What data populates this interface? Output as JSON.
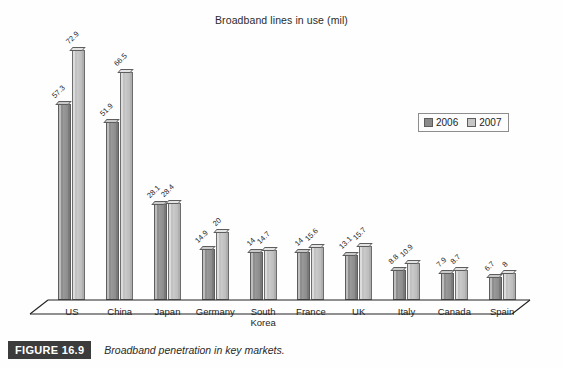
{
  "figure": {
    "badge": "FIGURE 16.9",
    "caption": "Broadband penetration in key markets."
  },
  "legend": {
    "position": "right",
    "entries": [
      {
        "label": "2006",
        "color": "#8a8a8a"
      },
      {
        "label": "2007",
        "color": "#c6c6c6"
      }
    ]
  },
  "chart_data": {
    "type": "bar",
    "title": "Broadband lines in use (mil)",
    "xlabel": "",
    "ylabel": "",
    "ylim": [
      0,
      80
    ],
    "grid": false,
    "legend_position": "right",
    "categories": [
      "US",
      "China",
      "Japan",
      "Germany",
      "South Korea",
      "France",
      "UK",
      "Italy",
      "Canada",
      "Spain"
    ],
    "category_labels": [
      [
        "US"
      ],
      [
        "China"
      ],
      [
        "Japan"
      ],
      [
        "Germany"
      ],
      [
        "South",
        "Korea"
      ],
      [
        "France"
      ],
      [
        "UK"
      ],
      [
        "Italy"
      ],
      [
        "Canada"
      ],
      [
        "Spain"
      ]
    ],
    "series": [
      {
        "name": "2006",
        "color": "#8a8a8a",
        "values": [
          57.3,
          51.9,
          28.1,
          14.9,
          14,
          14,
          13.1,
          8.8,
          7.9,
          6.7
        ],
        "labels": [
          "57.3",
          "51.9",
          "28.1",
          "14.9",
          "14",
          "14",
          "13.1",
          "8.8",
          "7.9",
          "6.7"
        ]
      },
      {
        "name": "2007",
        "color": "#c6c6c6",
        "values": [
          72.9,
          66.5,
          28.4,
          20,
          14.7,
          15.6,
          15.7,
          10.9,
          8.7,
          8
        ],
        "labels": [
          "72.9",
          "66.5",
          "28.4",
          "20",
          "14.7",
          "15.6",
          "15.7",
          "10.9",
          "8.7",
          "8"
        ]
      }
    ]
  }
}
